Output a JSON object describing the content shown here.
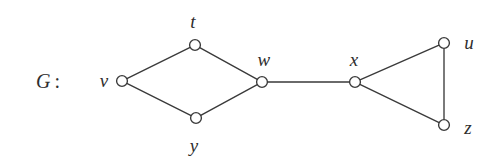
{
  "figure": {
    "width": 501,
    "height": 165,
    "background_color": "#ffffff",
    "ink_color": "#3a3a3a",
    "text_color": "#2e2e2e"
  },
  "graph_name": {
    "letter": "G",
    "separator": ":",
    "x": 48,
    "y": 81
  },
  "vertices": [
    {
      "id": "v",
      "label": "v",
      "cx": 122,
      "cy": 81,
      "r": 5.4,
      "label_x": 104,
      "label_y": 80
    },
    {
      "id": "t",
      "label": "t",
      "cx": 195,
      "cy": 45,
      "r": 5.4,
      "label_x": 193,
      "label_y": 21
    },
    {
      "id": "y",
      "label": "y",
      "cx": 196,
      "cy": 118,
      "r": 5.4,
      "label_x": 194,
      "label_y": 145
    },
    {
      "id": "w",
      "label": "w",
      "cx": 262,
      "cy": 82,
      "r": 5.4,
      "label_x": 264,
      "label_y": 59
    },
    {
      "id": "x",
      "label": "x",
      "cx": 355,
      "cy": 82,
      "r": 5.4,
      "label_x": 354,
      "label_y": 59
    },
    {
      "id": "u",
      "label": "u",
      "cx": 444,
      "cy": 43,
      "r": 5.4,
      "label_x": 469,
      "label_y": 42
    },
    {
      "id": "z",
      "label": "z",
      "cx": 444,
      "cy": 125,
      "r": 5.4,
      "label_x": 468,
      "label_y": 127
    }
  ],
  "edges": [
    {
      "from": "v",
      "to": "t"
    },
    {
      "from": "v",
      "to": "y"
    },
    {
      "from": "t",
      "to": "w"
    },
    {
      "from": "y",
      "to": "w"
    },
    {
      "from": "w",
      "to": "x"
    },
    {
      "from": "x",
      "to": "u"
    },
    {
      "from": "x",
      "to": "z"
    },
    {
      "from": "u",
      "to": "z"
    }
  ]
}
